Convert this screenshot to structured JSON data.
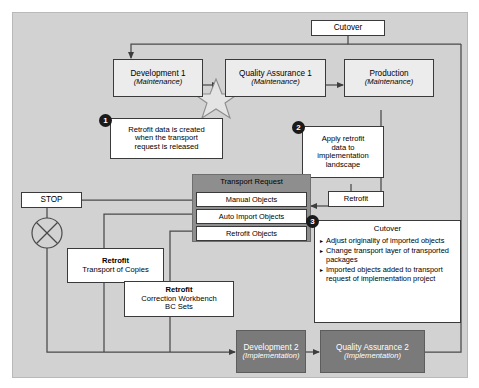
{
  "diagram": {
    "colors": {
      "panel_background": "#d2d2d2",
      "light_box": "#ececec",
      "white_box": "#ffffff",
      "dark_box": "#7a7a7a",
      "group_header": "#8e8e8e",
      "line": "#4a4a4a",
      "badge": "#1a1a1a"
    },
    "nodes": {
      "cutover_top": {
        "label": "Cutover"
      },
      "development1": {
        "label": "Development 1",
        "sublabel": "(Maintenance)"
      },
      "quality_assurance1": {
        "label": "Quality Assurance 1",
        "sublabel": "(Maintenance)"
      },
      "production": {
        "label": "Production",
        "sublabel": "(Maintenance)"
      },
      "development2": {
        "label": "Development 2",
        "sublabel": "(Implementation)"
      },
      "quality_assurance2": {
        "label": "Quality Assurance 2",
        "sublabel": "(Implementation)"
      },
      "stop": {
        "label": "STOP"
      },
      "retrofit_right": {
        "label": "Retrofit"
      },
      "retrofit_transport_of_copies": {
        "title": "Retrofit",
        "body": "Transport of Copies"
      },
      "retrofit_correction_workbench": {
        "title": "Retrofit",
        "line1": "Correction Workbench",
        "line2": "BC Sets"
      }
    },
    "transport_request": {
      "header": "Transport Request",
      "items": [
        {
          "label": "Manual Objects"
        },
        {
          "label": "Auto Import Objects"
        },
        {
          "label": "Retrofit Objects"
        }
      ]
    },
    "callouts": [
      {
        "number": "1",
        "lines": [
          "Retrofit data is created",
          "when the transport",
          "request is released"
        ]
      },
      {
        "number": "2",
        "lines": [
          "Apply retrofit",
          "data to",
          "implementation",
          "landscape"
        ]
      }
    ],
    "cutover_panel": {
      "number": "3",
      "title": "Cutover",
      "bullet_marker": "▸",
      "bullets": [
        "Adjust originality of imported objects",
        "Change transport layer of transported packages",
        "Imported objects added to transport request of implementation project"
      ]
    },
    "symbols": {
      "star": "star-burst-icon",
      "circle_x": "circle-x-icon"
    }
  }
}
